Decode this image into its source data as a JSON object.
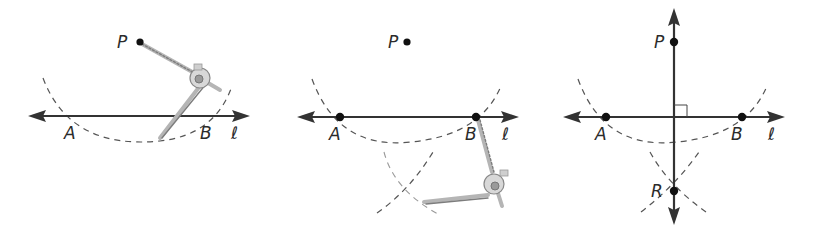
{
  "figure": {
    "colors": {
      "line": "#333333",
      "point": "#111111",
      "arc": "#555555",
      "compass": "#b5b5b5"
    },
    "panels": [
      {
        "id": "step-1",
        "labels": {
          "P": "P",
          "A": "A",
          "B": "B",
          "line": "ℓ"
        },
        "points": {
          "P": [
            140,
            42
          ]
        },
        "line_y": 116,
        "line_x": [
          28,
          250
        ],
        "label_pos": {
          "A": [
            72,
            138
          ],
          "B": [
            208,
            138
          ],
          "line": [
            234,
            138
          ]
        }
      },
      {
        "id": "step-2",
        "labels": {
          "P": "P",
          "A": "A",
          "B": "B",
          "line": "ℓ"
        },
        "points": {
          "P": [
            407,
            42
          ],
          "A": [
            340,
            117
          ],
          "B": [
            476,
            117
          ]
        },
        "line_y": 117,
        "line_x": [
          297,
          519
        ],
        "label_pos": {
          "A": [
            332,
            139
          ],
          "B": [
            468,
            139
          ],
          "line": [
            504,
            139
          ]
        }
      },
      {
        "id": "step-3",
        "labels": {
          "P": "P",
          "A": "A",
          "B": "B",
          "R": "R",
          "line": "ℓ"
        },
        "points": {
          "P": [
            674,
            42
          ],
          "A": [
            606,
            117
          ],
          "B": [
            742,
            117
          ],
          "R": [
            674,
            191
          ]
        },
        "line_y": 117,
        "line_x": [
          563,
          785
        ],
        "perpendicular_x": 674,
        "perpendicular_y": [
          8,
          225
        ],
        "label_pos": {
          "P": [
            655,
            48
          ],
          "A": [
            598,
            139
          ],
          "B": [
            734,
            139
          ],
          "R": [
            650,
            197
          ],
          "line": [
            770,
            139
          ]
        }
      }
    ]
  }
}
